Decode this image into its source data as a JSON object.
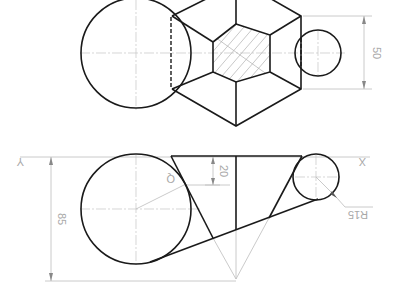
{
  "drawing": {
    "type": "engineering-drawing",
    "views": [
      "top-view",
      "front-view"
    ],
    "dimensions": {
      "top_height": "50",
      "front_height": "85",
      "front_offset": "20",
      "small_radius": "R15",
      "angle_label": "Q"
    },
    "axis_labels": {
      "left": "Y",
      "right": "X"
    },
    "colors": {
      "line": "#1a1a1a",
      "thin": "#bdbdbd",
      "text": "#a8a8a8"
    }
  }
}
